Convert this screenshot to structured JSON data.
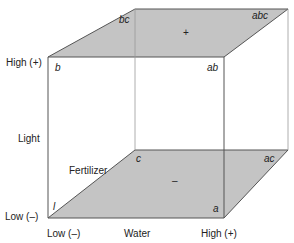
{
  "diagram": {
    "type": "factorial-cube",
    "colors": {
      "face_fill": "#c4c4c4",
      "edge": "#555555",
      "back_edge": "#999999",
      "text": "#222222"
    },
    "axes": {
      "vertical": {
        "name": "Light",
        "low": "Low (–)",
        "high": "High (+)"
      },
      "horizontal": {
        "name": "Water",
        "low": "Low (–)",
        "high": "High (+)"
      },
      "depth": {
        "name": "Fertilizer"
      }
    },
    "vertices": {
      "l": "l",
      "a": "a",
      "b": "b",
      "ab": "ab",
      "c": "c",
      "ac": "ac",
      "bc": "bc",
      "abc": "abc"
    },
    "faces": {
      "top_sign": "+",
      "bottom_sign": "–"
    }
  }
}
